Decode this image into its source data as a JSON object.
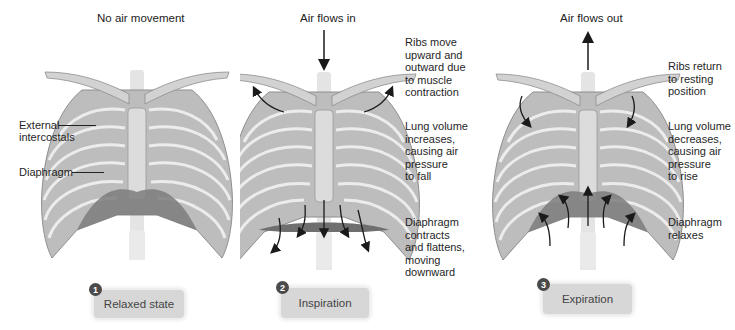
{
  "panels": [
    {
      "id": "relaxed",
      "top_caption": "No air movement",
      "side_labels": [],
      "left_labels": [
        "External intercostals",
        "Diaphragm"
      ],
      "step": {
        "number": "1",
        "label": "Relaxed state"
      }
    },
    {
      "id": "inspiration",
      "top_caption": "Air flows in",
      "side_labels": [
        "Ribs move upward and outward due to muscle contraction",
        "Lung volume increases, causing air pressure to fall",
        "Diaphragm contracts and flattens, moving downward"
      ],
      "step": {
        "number": "2",
        "label": "Inspiration"
      }
    },
    {
      "id": "expiration",
      "top_caption": "Air flows out",
      "side_labels": [
        "Ribs return to resting position",
        "Lung volume decreases, causing air pressure to rise",
        "Diaphragm relaxes"
      ],
      "step": {
        "number": "3",
        "label": "Expiration"
      }
    }
  ],
  "labels": {
    "p1_ext1": "External",
    "p1_ext2": "intercostals",
    "p1_dia": "Diaphragm",
    "p2_ribs": [
      "Ribs move",
      "upward and",
      "outward due",
      "to muscle",
      "contraction"
    ],
    "p2_lung": [
      "Lung volume",
      "increases,",
      "causing air",
      "pressure",
      "to fall"
    ],
    "p2_dia": [
      "Diaphragm",
      "contracts",
      "and flattens,",
      "moving",
      "downward"
    ],
    "p3_ribs": [
      "Ribs return",
      "to resting",
      "position"
    ],
    "p3_lung": [
      "Lung volume",
      "decreases,",
      "causing air",
      "pressure",
      "to rise"
    ],
    "p3_dia": [
      "Diaphragm",
      "relaxes"
    ]
  },
  "colors": {
    "bone": "#cfcfcf",
    "bone_shadow": "#9a9a9a",
    "diaphragm": "#7d7d7d",
    "step_box": "#d7d7d7",
    "step_badge": "#4a4a4a",
    "arrow": "#1a1a1a"
  }
}
